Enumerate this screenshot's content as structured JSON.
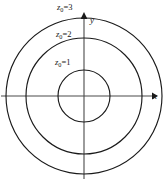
{
  "figure": {
    "type": "diagram",
    "background_color": "#ffffff",
    "stroke_color": "#1a1a1a",
    "axis_color": "#4a4a4a"
  },
  "axes": {
    "x_label": "x",
    "y_label": "y",
    "origin": {
      "x": 84,
      "y": 96
    },
    "x_arrow_tip": {
      "x": 157,
      "y": 96
    },
    "y_arrow_tip": {
      "x": 84,
      "y": 13
    }
  },
  "curves": [
    {
      "id": "z1",
      "label_variable": "z",
      "label_subscript": "0",
      "label_operator": "=",
      "label_value": "1",
      "radius_px": 26,
      "label_position": {
        "x": 55,
        "y": 58
      }
    },
    {
      "id": "z2",
      "label_variable": "z",
      "label_subscript": "0",
      "label_operator": "=",
      "label_value": "2",
      "radius_px": 58,
      "label_position": {
        "x": 56,
        "y": 30
      }
    },
    {
      "id": "z3",
      "label_variable": "z",
      "label_subscript": "0",
      "label_operator": "=",
      "label_value": "3",
      "radius_px": 78,
      "label_position": {
        "x": 57,
        "y": 3
      }
    }
  ]
}
